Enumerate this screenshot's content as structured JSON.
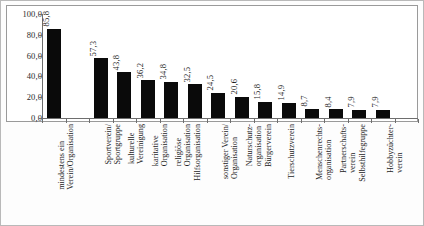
{
  "chart_data": {
    "type": "bar",
    "title": "",
    "subtitle": "",
    "xlabel": "",
    "ylabel": "",
    "ylim": [
      0,
      100
    ],
    "ytick_labels": [
      "100,0",
      "80,0",
      "60,0",
      "40,0",
      "20,0",
      "0,0"
    ],
    "ytick_values": [
      100,
      80,
      60,
      40,
      20,
      0
    ],
    "grid": false,
    "legend": null,
    "bar_color": "#0a0a0a",
    "value_label_format": "comma-decimal",
    "categories": [
      "mindestens ein Verein/Organisation",
      "Sportverein/ Sportgruppe",
      "kulturelle Vereinigung",
      "karitative Organisation",
      "religiöse Organisation",
      "Hilfsorganisation",
      "sonstiger Verein/ Organisation",
      "Naturschutz- organisation",
      "Bürgerverein",
      "Tierschutzverein",
      "Menschenrechts- organisation",
      "Partnerschafts- verein",
      "Selbsthilfegruppe",
      "Hobbyzüchter- verein"
    ],
    "category_lines": [
      [
        "mindestens ein",
        "Verein/Organisation"
      ],
      [
        "Sportverein/",
        "Sportgruppe"
      ],
      [
        "kulturelle",
        "Vereinigung"
      ],
      [
        "karitative",
        "Organisation"
      ],
      [
        "religiöse",
        "Organisation"
      ],
      [
        "Hilfsorganisation"
      ],
      [
        "sonstiger Verein/",
        "Organisation"
      ],
      [
        "Naturschutz-",
        "organisation"
      ],
      [
        "Bürgerverein"
      ],
      [
        "Tierschutzverein"
      ],
      [
        "Menschenrechts-",
        "organisation"
      ],
      [
        "Partnerschafts-",
        "verein"
      ],
      [
        "Selbsthilfegruppe"
      ],
      [
        "Hobbyzüchter-",
        "verein"
      ]
    ],
    "values": [
      85.8,
      57.3,
      43.8,
      36.2,
      34.8,
      32.5,
      24.5,
      20.6,
      15.8,
      14.9,
      8.7,
      8.4,
      7.9,
      7.9
    ],
    "value_labels": [
      "85,8",
      "57,3",
      "43,8",
      "36,2",
      "34,8",
      "32,5",
      "24,5",
      "20,6",
      "15,8",
      "14,9",
      "8,7",
      "8,4",
      "7,9",
      "7,9"
    ],
    "slot_index": [
      0,
      2,
      3,
      4,
      5,
      6,
      7,
      8,
      9,
      10,
      11,
      12,
      13,
      14
    ],
    "slot_count": 16
  }
}
